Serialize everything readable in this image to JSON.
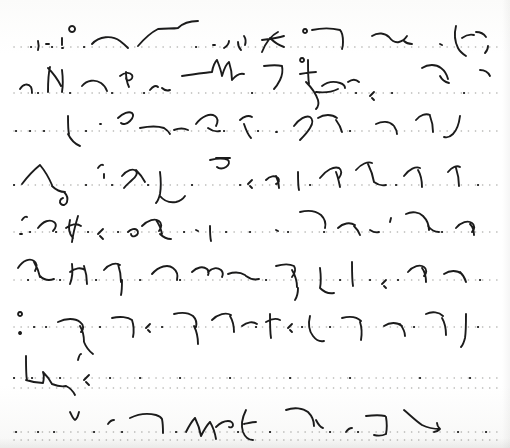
{
  "page": {
    "kind": "scanned-handwritten-page",
    "script_system": "shorthand-stenography",
    "title": "Shorthand Manuscript Page",
    "width": 510,
    "height": 448,
    "paper_color": "#fdfdfc",
    "ink_color": "#1b1b1b",
    "rule_color": "#9a9a96",
    "legible_text": "",
    "header_note": "faint clipped text at top edge, illegible"
  },
  "ruling": {
    "style": "dotted",
    "line_count": 11,
    "dot_color": "#9a9a96",
    "dot_radius": 0.8,
    "dot_spacing": 7.0,
    "left_margin": 14,
    "right_margin": 498,
    "baselines": [
      47,
      93,
      131,
      185,
      232,
      280,
      327,
      378,
      388,
      432,
      440
    ]
  },
  "rows": [
    {
      "index": 1,
      "baseline": 47,
      "strokes": "M22 46 M38 41 c1 4 1 6 0 9 M46 44 l3 0 M62 38 c0 3 0 5 0 7 M62 48 l1 0 M72 32 a3 3 0 1 1 0.1 0 M92 44 c7 -8 20 -9 28 -3 c4 3 6 5 8 7 M138 46 c6 -7 14 -14 20 -17 c8 -1 14 0 20 -1 M178 28 c5 -5 12 -7 20 -7 M213 45 l2 0 M224 48 c3 -2 5 -4 5 -7 M238 42 c0 4 1 6 3 8 M244 36 c2 3 2 6 1 9 M262 52 c4 -10 10 -17 16 -20 M270 38 c4 4 8 7 14 9 M262 40 c8 -1 16 -2 22 -4 M305 33 a2 2 0 1 1 0.1 0 M312 30 c9 -2 20 -2 28 0 c3 3 3 7 3 12 c0 3 0 5 -1 7 M372 36 c6 -4 13 -3 17 1 c3 4 6 6 10 5 c4 -1 6 -3 8 -6 M404 41 c2 2 5 3 8 3 M440 44 l2 1 M456 26 c-2 8 -1 16 2 22 c2 4 5 6 8 8 M462 38 c4 -3 8 -4 12 -3 M476 32 c4 0 8 2 10 5 M488 46 c0 3 -1 5 -3 7",
      "dots_and_ticks": "M31 47 l0.1 0 M52 47 l0.1 0 M84 47 l0.1 0 M196 47 l0.1 0"
    },
    {
      "index": 2,
      "baseline": 93,
      "strokes": "M20 89 c3 -5 8 -6 11 -2 c1 2 1 4 1 6 M48 92 c0 -13 1 -21 2 -25 M48 68 c6 6 10 12 13 18 M62 70 c1 8 1 16 0 22 M82 86 c5 -6 13 -7 19 -3 c3 2 5 5 6 8 M120 76 c5 -4 10 -4 12 -1 c1 2 0 4 -2 5 c-2 1 -4 0 -4 -2 M126 72 c0 6 1 11 3 15 M150 90 c3 -4 6 -5 8 -3 M162 88 c2 2 5 3 8 2 M182 76 c12 -2 22 -3 30 -4 M212 72 c1 -6 3 -10 5 -12 M217 60 c2 5 4 10 5 16 M222 76 c2 -7 4 -12 7 -14 M229 62 c2 6 3 12 3 18 M232 80 c4 -5 8 -7 12 -6 M264 66 c8 -1 14 -1 18 0 c1 5 0 10 -2 14 c-2 4 -4 7 -6 9 M302 62 a2 2 0 1 1 0.1 0 M308 60 c0 10 0 18 1 24 M300 74 c6 -1 12 -2 16 -2 M306 82 c6 6 10 12 12 18 c1 4 0 7 -2 9 M322 86 c5 -4 12 -5 18 -3 c3 1 5 3 5 5 M316 92 c8 1 16 0 22 -3 M348 82 c4 -3 8 -3 11 0 M372 98 l2 2 M370 96 l4 -4 M422 68 c6 -4 14 -4 19 0 c4 3 6 7 7 11 M440 76 c2 4 5 6 9 7 M480 70 c4 0 8 2 10 6",
      "dots_and_ticks": "M38 93 l0.1 0 M70 93 l0.1 0 M112 93 l0.1 0 M144 93 l0.1 0 M252 93 l0.1 0 M356 93 l0.1 0 M392 93 l0.1 0 M464 93 l0.1 0"
    },
    {
      "index": 3,
      "baseline": 131,
      "strokes": "M68 116 c0 8 0 14 1 18 M68 134 c3 6 7 10 12 12 M100 124 l1 0 M118 118 c5 -5 11 -7 14 -5 c2 2 1 5 -2 8 c-3 3 -7 4 -9 2 M140 128 c10 -2 18 -2 24 0 M164 128 c3 2 5 4 6 6 M174 130 c5 -2 10 -2 14 0 M196 124 c6 -8 14 -11 19 -8 c3 2 3 6 1 10 M208 128 c4 3 8 4 12 3 M240 120 c4 -4 9 -5 12 -3 M244 124 c2 6 4 11 7 14 M276 132 l1 0 M294 126 c5 -7 12 -11 16 -9 c3 2 3 6 0 11 c-3 5 -7 9 -10 12 M318 118 c6 -4 14 -4 19 0 M336 120 c3 4 5 8 6 12 M376 124 c6 -3 13 -3 17 1 M394 126 c2 3 3 5 3 8 M416 120 c4 -5 10 -7 14 -5 M430 116 c2 5 3 11 3 16 M460 116 c-1 8 -3 14 -7 18 c-3 3 -6 4 -9 3",
      "dots_and_ticks": "M16 131 l0.1 0 M30 131 l0.1 0 M44 131 l0.1 0 M86 131 l0.1 0 M224 131 l0.1 0 M258 131 l0.1 0 M350 131 l0.1 0"
    },
    {
      "index": 4,
      "baseline": 185,
      "strokes": "M22 184 c6 -8 13 -15 18 -19 M40 165 c5 6 9 13 12 20 M52 186 c4 4 8 6 13 6 M64 192 c3 3 4 7 3 10 c-1 3 -4 4 -6 2 c-2 -2 -1 -5 2 -6 M98 168 c2 -3 4 -4 5 -3 M104 174 l0 4 M122 176 c5 -6 11 -8 14 -5 c2 2 0 6 -4 9 c-3 3 -6 5 -8 8 M136 170 c4 4 7 8 9 12 M160 172 c1 8 1 16 0 22 c-1 4 -2 7 -4 9 M160 196 c4 5 10 7 16 6 c4 -1 7 -3 9 -6 M210 160 c8 -2 14 -2 18 0 c2 2 1 5 -2 7 c-3 2 -7 2 -9 0 M216 158 l14 0 M250 186 l2 2 M248 184 l4 -4 M266 180 c4 -4 9 -5 12 -2 c2 2 1 5 -2 6 M276 176 c2 4 3 8 3 12 M298 172 c0 8 0 14 1 18 M320 178 c6 -8 14 -12 19 -10 c3 2 3 6 0 10 M336 172 c2 5 3 10 4 15 M356 170 c5 -6 12 -9 16 -7 M368 164 c3 6 5 12 6 18 M374 182 c4 3 8 4 12 3 M404 176 c5 -7 12 -10 16 -8 M418 170 c3 5 4 11 4 17 M448 172 c4 -5 9 -7 12 -5 M456 168 c2 6 3 12 3 18",
      "dots_and_ticks": "M14 185 l0.1 0 M86 185 l0.1 0 M112 185 l0.1 0 M148 185 l0.1 0 M192 185 l0.1 0 M240 185 l0.1 0 M310 185 l0.1 0 M396 185 l0.1 0 M478 185 l0.1 0"
    },
    {
      "index": 5,
      "baseline": 232,
      "strokes": "M22 220 c2 -3 4 -4 5 -3 M20 234 l2 0 M38 228 c5 -7 12 -9 16 -6 c3 2 2 6 -1 9 M70 220 c-2 8 -1 14 3 18 M66 228 c5 -4 11 -5 15 -2 M78 216 c-3 10 -5 18 -6 26 M100 236 l3 3 M98 234 l5 -5 M128 232 c3 -3 7 -4 9 -2 c2 2 1 5 -2 6 c-2 1 -4 0 -4 -2 M142 226 c6 -6 13 -8 17 -5 c3 2 3 6 0 10 M156 220 c3 4 5 9 6 14 M160 234 c3 3 7 5 11 5 M196 230 l2 1 M210 226 c0 6 0 11 1 15 M276 230 l2 1 M300 212 c8 -2 16 -1 21 3 c4 4 5 9 4 13 M338 228 c5 -5 12 -6 17 -3 M354 226 c3 3 5 6 6 9 M370 230 c3 2 6 3 9 2 M390 222 l1 -4 M406 214 c6 -3 13 -2 17 2 c4 4 6 9 6 14 M428 226 c3 4 7 6 11 6 M456 228 c5 -6 12 -8 16 -5 c3 2 3 6 0 9 M470 224 c3 3 4 7 4 11",
      "dots_and_ticks": "M30 232 l0.1 0 M56 232 l0.1 0 M88 232 l0.1 0 M118 232 l0.1 0 M184 232 l0.1 0 M226 232 l0.1 0 M250 232 l0.1 0 M288 232 l0.1 0 M324 232 l0.1 0 M442 232 l0.1 0"
    },
    {
      "index": 6,
      "baseline": 280,
      "strokes": "M18 268 c5 -8 12 -10 16 -7 c3 2 3 6 1 10 M34 262 c3 5 5 10 6 15 M40 276 c4 4 9 5 14 3 M72 264 c1 8 0 15 -2 20 M70 272 c5 -4 11 -5 15 -2 M84 266 c2 6 3 12 3 18 M104 270 c5 -6 12 -8 16 -5 M118 264 c2 6 3 12 3 18 M122 280 c0 6 0 11 -1 15 M152 274 c7 -8 16 -10 21 -6 c4 3 5 8 4 12 M192 272 c5 -5 11 -6 15 -3 c2 2 2 4 1 6 M208 272 c4 -4 9 -5 13 -2 c2 2 2 5 1 7 M228 274 c6 -2 12 -2 17 1 M246 276 c4 3 9 4 13 3 M276 266 c7 -2 14 -2 18 0 c2 3 1 7 -2 11 M292 270 c3 5 5 11 5 17 M298 288 c0 5 -1 9 -3 12 M320 268 c1 8 1 15 0 20 M320 288 c4 4 9 6 14 5 M352 262 c0 10 0 18 1 24 M384 286 l2 2 M382 284 l4 -4 M408 272 c5 -6 12 -8 16 -5 c3 2 3 6 0 9 M422 268 c3 4 4 9 4 14 M444 274 c6 -4 13 -4 18 0 M460 272 c3 3 5 6 6 10",
      "dots_and_ticks": "M28 280 l0.1 0 M60 280 l0.1 0 M96 280 l0.1 0 M140 280 l0.1 0 M180 280 l0.1 0 M266 280 l0.1 0 M340 280 l0.1 0 M370 280 l0.1 0 M398 280 l0.1 0 M480 280 l0.1 0"
    },
    {
      "index": 7,
      "baseline": 327,
      "strokes": "M20 316 a2 2 0 1 1 0.1 0 M20 334 a1 1 0 1 1 0.1 0 M58 322 c8 -4 17 -4 22 0 c4 3 4 7 1 10 M80 326 c3 5 4 11 4 16 M84 342 c2 5 5 9 9 12 M112 318 c8 -2 16 -1 20 2 M132 320 c2 6 2 12 1 17 M148 330 l2 2 M146 328 l4 -4 M174 314 c8 -2 15 -1 19 2 c3 3 4 7 3 11 M194 326 c3 6 4 12 4 18 M212 320 c6 -6 14 -8 19 -5 M230 316 c3 5 4 11 4 16 M242 326 c5 -4 11 -5 15 -2 M270 314 c0 10 0 18 1 24 M266 322 c5 -3 10 -4 14 -2 M290 330 l2 2 M288 328 l4 -4 M310 316 c-2 8 -1 15 3 20 c3 4 7 6 11 5 M342 318 c8 -2 15 -1 19 3 M360 322 c2 6 2 12 1 18 M384 326 c6 -4 13 -4 18 0 M400 324 c3 4 5 8 5 12 M426 314 c6 -3 13 -2 17 2 M442 318 c3 5 4 11 4 17 M466 314 c0 10 0 18 -1 24 c-1 4 -2 7 -4 9",
      "dots_and_ticks": "M34 327 l0.1 0 M46 327 l0.1 0 M100 327 l0.1 0 M162 327 l0.1 0 M256 327 l0.1 0 M302 327 l0.1 0 M330 327 l0.1 0 M414 327 l0.1 0 M478 327 l0.1 0"
    },
    {
      "index": 8,
      "baseline": 378,
      "strokes": "M26 356 c0 12 0 20 1 24 M26 380 c6 2 12 3 17 3 M43 383 c1 -4 1 -8 0 -11 M43 372 c4 4 7 8 9 12 M52 384 c5 2 10 3 14 2 M66 386 c4 2 7 5 9 9 M78 360 c1 -4 2 -6 3 -6 M86 382 l3 3 M84 380 l5 -5",
      "dots_and_ticks": "M14 378 l0.1 0 M32 378 l0.1 0 M60 378 l0.1 0 M110 378 l0.1 0 M140 378 l0.1 0 M180 378 l0.1 0 M230 378 l0.1 0 M290 378 l0.1 0 M350 378 l0.1 0 M420 378 l0.1 0 M470 378 l0.1 0"
    },
    {
      "index": 9,
      "baseline": 388,
      "strokes": "",
      "dots_and_ticks": ""
    },
    {
      "index": 10,
      "baseline": 432,
      "strokes": "M70 412 c2 4 3 7 5 8 c2 -1 3 -4 4 -8 M108 424 c2 -3 4 -4 6 -4 M130 418 c8 -4 18 -5 26 -3 c3 1 5 2 6 4 M162 419 c1 5 1 9 1 14 M186 432 c3 -6 6 -11 9 -14 M195 418 c3 6 5 12 6 18 M201 436 c3 -6 6 -11 9 -14 M210 422 c3 5 5 11 6 17 M216 427 c4 -4 8 -6 12 -6 c3 0 5 2 5 4 c0 2 -2 3 -4 2 M246 410 c-4 8 -5 16 -3 22 c2 5 6 8 10 8 M244 424 c5 -1 9 -2 12 -2 M286 410 c8 -3 17 -2 22 2 c4 4 6 9 6 14 M316 420 c2 4 4 7 7 8 M346 432 c2 -3 4 -4 6 -4 M366 416 c8 -1 15 -1 19 0 M386 417 c1 6 1 12 0 17 M386 434 c-4 2 -8 2 -12 1 M404 410 c6 5 12 11 18 15 M422 425 c6 3 12 4 18 4 M440 429 c-2 2 -4 3 -6 3 M440 429 c-2 -2 -3 -4 -3 -6",
      "dots_and_ticks": "M16 432 l0.1 0 M38 432 l0.1 0 M54 432 l0.1 0 M94 432 l0.1 0 M122 432 l0.1 0 M176 432 l0.1 0 M238 432 l0.1 0 M270 432 l0.1 0 M330 432 l0.1 0 M358 432 l0.1 0 M458 432 l0.1 0 M486 432 l0.1 0"
    },
    {
      "index": 11,
      "baseline": 440,
      "strokes": "",
      "dots_and_ticks": ""
    }
  ]
}
